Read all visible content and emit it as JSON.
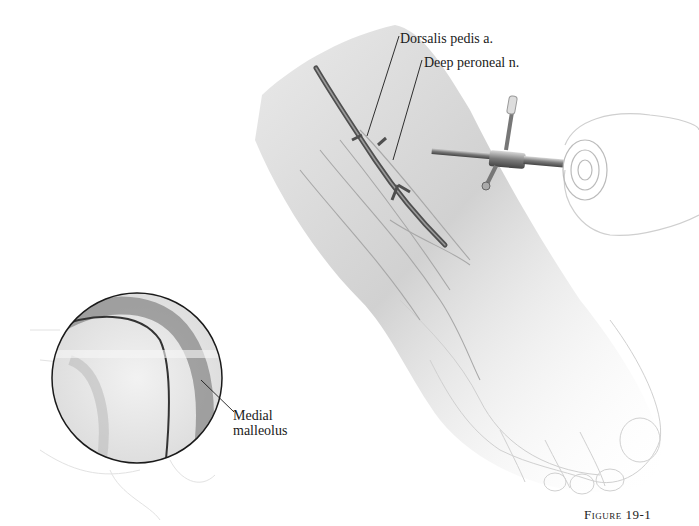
{
  "figure": {
    "caption": "Figure 19-1",
    "labels": {
      "dorsalis_pedis": "Dorsalis pedis a.",
      "deep_peroneal": "Deep peroneal n.",
      "medial_malleolus_line1": "Medial",
      "medial_malleolus_line2": "malleolus"
    },
    "colors": {
      "line": "#1a1a1a",
      "skin_shade": "#bdbdbd",
      "vessel": "#555555",
      "instrument": "#8a8a8a"
    }
  }
}
